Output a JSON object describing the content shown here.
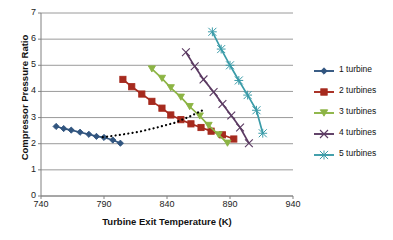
{
  "chart_data": {
    "type": "line",
    "title": "",
    "xlabel": "Turbine Exit Temperature (K)",
    "ylabel": "Compressor Pressure Ratio",
    "xlim": [
      740,
      940
    ],
    "ylim": [
      0,
      7
    ],
    "xticks": [
      740,
      790,
      840,
      890,
      940
    ],
    "yticks": [
      0,
      1,
      2,
      3,
      4,
      5,
      6,
      7
    ],
    "grid": "horizontal",
    "legend_position": "right",
    "series": [
      {
        "name": "1 turbine",
        "color": "#31557F",
        "marker": "diamond",
        "x": [
          752,
          758,
          764,
          771,
          778,
          784,
          790,
          797,
          803
        ],
        "y": [
          2.66,
          2.58,
          2.52,
          2.44,
          2.36,
          2.28,
          2.24,
          2.14,
          2.02
        ]
      },
      {
        "name": "2 turbines",
        "color": "#A62A1E",
        "marker": "square",
        "x": [
          805,
          812,
          820,
          828,
          836,
          843,
          851,
          859,
          867,
          875,
          884,
          893
        ],
        "y": [
          4.46,
          4.18,
          3.9,
          3.62,
          3.36,
          3.1,
          2.92,
          2.76,
          2.62,
          2.48,
          2.34,
          2.18
        ]
      },
      {
        "name": "3 turbines",
        "color": "#8CB444",
        "marker": "triangle",
        "x": [
          828,
          836,
          843,
          851,
          858,
          866,
          873,
          881,
          888
        ],
        "y": [
          4.86,
          4.5,
          4.14,
          3.78,
          3.42,
          3.06,
          2.7,
          2.34,
          2.02
        ]
      },
      {
        "name": "4 turbines",
        "color": "#5B3A62",
        "marker": "cross",
        "x": [
          855,
          862,
          869,
          877,
          884,
          891,
          898,
          905
        ],
        "y": [
          5.5,
          4.96,
          4.46,
          3.98,
          3.52,
          3.08,
          2.62,
          2.02
        ]
      },
      {
        "name": "5 turbines",
        "color": "#3A9BA8",
        "marker": "star",
        "x": [
          876,
          883,
          890,
          897,
          904,
          911,
          916
        ],
        "y": [
          6.28,
          5.62,
          5.0,
          4.42,
          3.86,
          3.28,
          2.4
        ]
      }
    ],
    "trend_line": {
      "name": "trend",
      "color": "#000000",
      "style": "dotted",
      "x": [
        789,
        803,
        818,
        832,
        846,
        858,
        870
      ],
      "y": [
        2.25,
        2.34,
        2.46,
        2.62,
        2.8,
        3.04,
        3.32
      ]
    }
  },
  "legend": {
    "items": [
      {
        "label": "1 turbine",
        "color": "#31557F",
        "marker": "diamond"
      },
      {
        "label": "2 turbines",
        "color": "#A62A1E",
        "marker": "square"
      },
      {
        "label": "3 turbines",
        "color": "#8CB444",
        "marker": "triangle"
      },
      {
        "label": "4 turbines",
        "color": "#5B3A62",
        "marker": "cross"
      },
      {
        "label": "5 turbines",
        "color": "#3A9BA8",
        "marker": "star"
      }
    ]
  },
  "axes": {
    "x_title": "Turbine Exit Temperature (K)",
    "y_title": "Compressor Pressure Ratio",
    "x_tick_labels": [
      "740",
      "790",
      "840",
      "890",
      "940"
    ],
    "y_tick_labels": [
      "0",
      "1",
      "2",
      "3",
      "4",
      "5",
      "6",
      "7"
    ]
  },
  "style": {
    "grid_color": "#808080",
    "axis_color": "#808080",
    "background": "#FFFFFF",
    "text_color": "#111111"
  }
}
